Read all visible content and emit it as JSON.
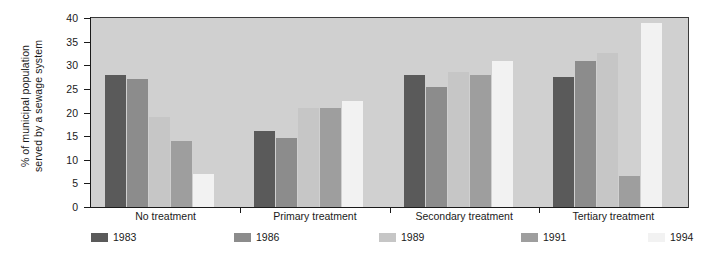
{
  "chart_data": {
    "type": "bar",
    "title": "",
    "xlabel": "",
    "ylabel": "% of municipal population\nserved by a sewage system",
    "ylim": [
      0,
      40
    ],
    "yticks": [
      0,
      5,
      10,
      15,
      20,
      25,
      30,
      35,
      40
    ],
    "ytick_labels": [
      "0",
      "5",
      "10",
      "15",
      "20",
      "25",
      "30",
      "35",
      "40"
    ],
    "grid": false,
    "legend_position": "bottom",
    "categories": [
      "No treatment",
      "Primary treatment",
      "Secondary treatment",
      "Tertiary treatment"
    ],
    "series": [
      {
        "name": "1983",
        "color": "#5a5a5a",
        "values": [
          28.0,
          16.0,
          28.0,
          27.5
        ]
      },
      {
        "name": "1986",
        "color": "#8c8c8c",
        "values": [
          27.0,
          14.5,
          25.5,
          31.0
        ]
      },
      {
        "name": "1989",
        "color": "#c6c6c6",
        "values": [
          19.0,
          21.0,
          28.5,
          32.5
        ]
      },
      {
        "name": "1991",
        "color": "#9e9e9e",
        "values": [
          14.0,
          21.0,
          28.0,
          6.5
        ]
      },
      {
        "name": "1994",
        "color": "#f2f2f2",
        "values": [
          7.0,
          22.5,
          31.0,
          39.0
        ]
      }
    ]
  },
  "legend": {
    "items": [
      {
        "label": "1983",
        "color": "#5a5a5a"
      },
      {
        "label": "1986",
        "color": "#8c8c8c"
      },
      {
        "label": "1989",
        "color": "#c6c6c6"
      },
      {
        "label": "1991",
        "color": "#9e9e9e"
      },
      {
        "label": "1994",
        "color": "#f2f2f2"
      }
    ]
  },
  "style": {
    "plot_background": "#d0d0d0",
    "axis_color": "#1a1a1a",
    "text_color": "#1a1a1a",
    "page_background": "#ffffff"
  }
}
